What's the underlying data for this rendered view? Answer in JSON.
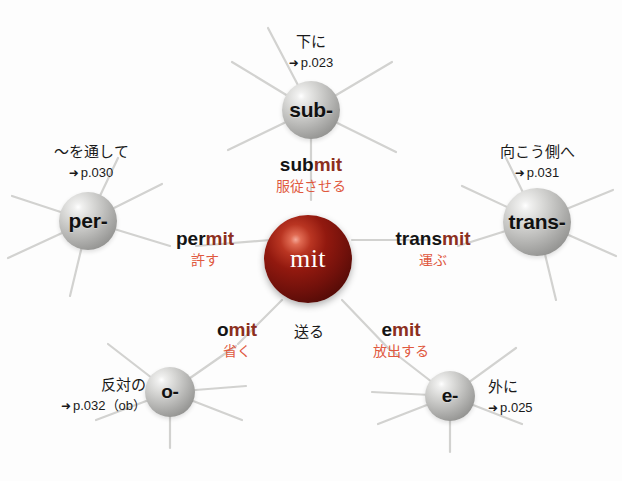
{
  "diagram": {
    "core": {
      "label": "mit",
      "meaning": "送る",
      "color": "#8c2f20"
    },
    "accent_color": "#e0593f",
    "stem_color": "#8c2f20",
    "arrow_glyph": "➜",
    "nodes": [
      {
        "id": "sub",
        "label": "sub-",
        "gloss": "下に",
        "pageref": "p.023"
      },
      {
        "id": "per",
        "label": "per-",
        "gloss": "〜を通して",
        "pageref": "p.030"
      },
      {
        "id": "trans",
        "label": "trans-",
        "gloss": "向こう側へ",
        "pageref": "p.031"
      },
      {
        "id": "o",
        "label": "o-",
        "gloss": "反対の",
        "pageref": "p.032（ob）"
      },
      {
        "id": "e",
        "label": "e-",
        "gloss": "外に",
        "pageref": "p.025"
      }
    ],
    "words": [
      {
        "id": "submit",
        "prefix": "sub",
        "stem": "mit",
        "ja": "服従させる"
      },
      {
        "id": "permit",
        "prefix": "per",
        "stem": "mit",
        "ja": "許す"
      },
      {
        "id": "transmit",
        "prefix": "trans",
        "stem": "mit",
        "ja": "運ぶ"
      },
      {
        "id": "omit",
        "prefix": "o",
        "stem": "mit",
        "ja": "省く"
      },
      {
        "id": "emit",
        "prefix": "e",
        "stem": "mit",
        "ja": "放出する"
      }
    ]
  }
}
